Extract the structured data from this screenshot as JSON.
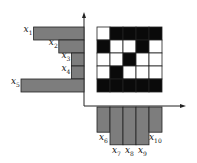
{
  "diagram": {
    "type": "binary-image projection (row and column sums)",
    "grid": {
      "rows": 5,
      "cols": 5,
      "cells": [
        [
          0,
          1,
          1,
          1,
          1
        ],
        [
          1,
          0,
          0,
          1,
          0
        ],
        [
          0,
          0,
          1,
          0,
          0
        ],
        [
          0,
          1,
          0,
          0,
          0
        ],
        [
          1,
          1,
          1,
          1,
          1
        ]
      ],
      "black_color": "#0a0a0a",
      "white_color": "#ffffff"
    },
    "row_projections": [
      {
        "label": "x",
        "sub": "1",
        "value": 4
      },
      {
        "label": "x",
        "sub": "2",
        "value": 2
      },
      {
        "label": "x",
        "sub": "3",
        "value": 1
      },
      {
        "label": "x",
        "sub": "4",
        "value": 1
      },
      {
        "label": "x",
        "sub": "5",
        "value": 5
      }
    ],
    "column_projections": [
      {
        "label": "x",
        "sub": "6",
        "value": 2
      },
      {
        "label": "x",
        "sub": "7",
        "value": 3
      },
      {
        "label": "x",
        "sub": "8",
        "value": 3
      },
      {
        "label": "x",
        "sub": "9",
        "value": 3
      },
      {
        "label": "x",
        "sub": "10",
        "value": 2
      }
    ],
    "bar_color": "#7d7d7d"
  }
}
